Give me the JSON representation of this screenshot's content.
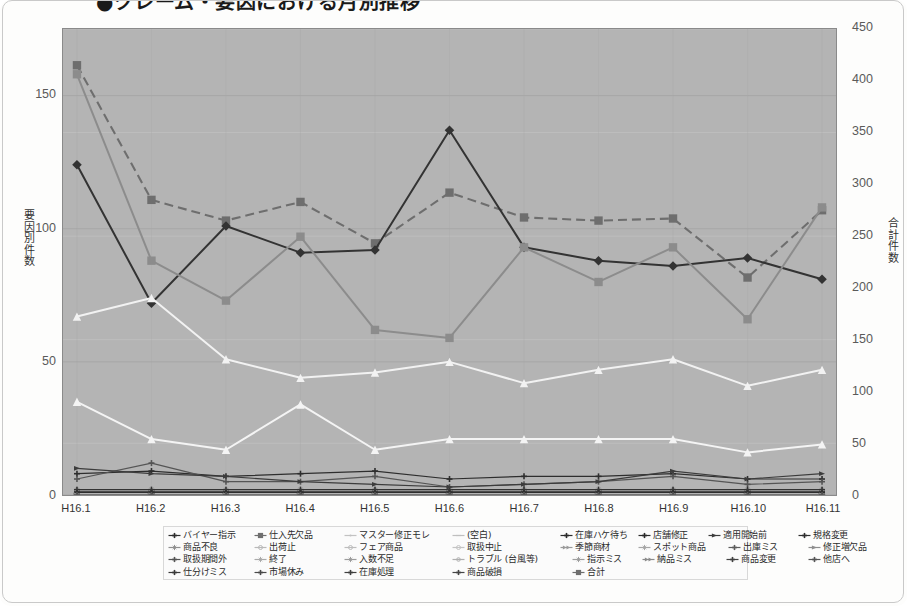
{
  "title": "●クレーム・要因における月別推移",
  "axes": {
    "y_left_title": "要因別件数",
    "y_right_title": "合計件数",
    "y_left_ticks": [
      0,
      50,
      100,
      150
    ],
    "y_right_ticks": [
      0,
      50,
      100,
      150,
      200,
      250,
      300,
      350,
      400,
      450
    ],
    "x_ticks": [
      "H16.1",
      "H16.2",
      "H16.3",
      "H16.4",
      "H16.5",
      "H16.6",
      "H16.7",
      "H16.8",
      "H16.9",
      "H16.10",
      "H16.11"
    ]
  },
  "chart_data": {
    "type": "line",
    "title": "●クレーム・要因における月別推移",
    "xlabel": "",
    "ylabel": "要因別件数",
    "ylabel_secondary": "合計件数",
    "grid": true,
    "legend_position": "bottom",
    "ylim": [
      0,
      175
    ],
    "ylim_secondary": [
      0,
      450
    ],
    "categories": [
      "H16.1",
      "H16.2",
      "H16.3",
      "H16.4",
      "H16.5",
      "H16.6",
      "H16.7",
      "H16.8",
      "H16.9",
      "H16.10",
      "H16.11"
    ],
    "series": [
      {
        "name": "バイヤー指示",
        "marker": "cross",
        "color": "#2e2e2e",
        "axis": "left",
        "values": [
          8,
          9,
          7,
          8,
          9,
          6,
          7,
          7,
          8,
          6,
          6
        ]
      },
      {
        "name": "商品不良",
        "marker": "star",
        "color": "#8f8f8f",
        "axis": "left",
        "values": [
          2,
          2,
          2,
          2,
          2,
          2,
          2,
          2,
          2,
          2,
          2
        ]
      },
      {
        "name": "取扱期間外",
        "marker": "cross",
        "color": "#555555",
        "axis": "left",
        "values": [
          6,
          12,
          5,
          5,
          7,
          3,
          4,
          5,
          7,
          4,
          5
        ]
      },
      {
        "name": "仕分けミス",
        "marker": "cross",
        "color": "#3a3a3a",
        "axis": "left",
        "values": [
          1,
          1,
          1,
          1,
          1,
          1,
          1,
          1,
          1,
          1,
          1
        ]
      },
      {
        "name": "仕入先欠品",
        "marker": "square",
        "color": "#8a8a8a",
        "axis": "left",
        "values": [
          1,
          1,
          1,
          1,
          1,
          1,
          1,
          1,
          1,
          1,
          1
        ]
      },
      {
        "name": "出荷止",
        "marker": "circle-open",
        "color": "#b9b9b9",
        "axis": "left",
        "values": [
          0,
          0,
          0,
          0,
          0,
          0,
          0,
          0,
          0,
          0,
          0
        ]
      },
      {
        "name": "終了",
        "marker": "star",
        "color": "#aaaaaa",
        "axis": "left",
        "values": [
          0,
          0,
          0,
          0,
          0,
          0,
          0,
          0,
          0,
          0,
          0
        ]
      },
      {
        "name": "市場休み",
        "marker": "cross",
        "color": "#4a4a4a",
        "axis": "left",
        "values": [
          1,
          1,
          1,
          1,
          1,
          1,
          1,
          1,
          1,
          1,
          1
        ]
      },
      {
        "name": "マスター修正モレ",
        "marker": "dot",
        "color": "#c0c0c0",
        "axis": "left",
        "values": [
          0,
          0,
          0,
          0,
          0,
          0,
          0,
          0,
          0,
          0,
          0
        ]
      },
      {
        "name": "フェア商品",
        "marker": "circle-open",
        "color": "#bdbdbd",
        "axis": "left",
        "values": [
          0,
          0,
          0,
          0,
          0,
          0,
          0,
          0,
          0,
          0,
          0
        ]
      },
      {
        "name": "入数不足",
        "marker": "star",
        "color": "#9c9c9c",
        "axis": "left",
        "values": [
          1,
          1,
          1,
          1,
          1,
          1,
          1,
          1,
          1,
          1,
          1
        ]
      },
      {
        "name": "在庫処理",
        "marker": "cross",
        "color": "#3f3f3f",
        "axis": "left",
        "values": [
          1,
          1,
          1,
          1,
          1,
          1,
          1,
          1,
          1,
          1,
          1
        ]
      },
      {
        "name": "(空白)",
        "marker": "dash",
        "color": "#c4c4c4",
        "axis": "left",
        "values": [
          0,
          0,
          0,
          0,
          0,
          0,
          0,
          0,
          0,
          0,
          0
        ]
      },
      {
        "name": "取扱中止",
        "marker": "circle-open",
        "color": "#c4c4c4",
        "axis": "left",
        "values": [
          0,
          0,
          0,
          0,
          0,
          0,
          0,
          0,
          0,
          0,
          0
        ]
      },
      {
        "name": "トラブル (台風等)",
        "marker": "circle-dot",
        "color": "#b0b0b0",
        "axis": "left",
        "values": [
          0,
          0,
          0,
          0,
          0,
          0,
          0,
          0,
          0,
          0,
          0
        ]
      },
      {
        "name": "商品破損",
        "marker": "cross",
        "color": "#454545",
        "axis": "left",
        "values": [
          1,
          1,
          1,
          1,
          1,
          1,
          1,
          1,
          1,
          1,
          1
        ]
      },
      {
        "name": "在庫ハケ待ち",
        "marker": "cross",
        "color": "#333333",
        "axis": "left",
        "values": [
          2,
          2,
          2,
          2,
          2,
          2,
          2,
          2,
          2,
          2,
          2
        ]
      },
      {
        "name": "季節商材",
        "marker": "double-arrow",
        "color": "#9a9a9a",
        "axis": "left",
        "values": [
          0,
          0,
          0,
          0,
          0,
          0,
          0,
          0,
          0,
          0,
          0
        ]
      },
      {
        "name": "指示ミス",
        "marker": "star",
        "color": "#9e9e9e",
        "axis": "left",
        "values": [
          1,
          1,
          1,
          1,
          1,
          1,
          1,
          1,
          1,
          1,
          1
        ]
      },
      {
        "name": "店舗修正",
        "marker": "cross",
        "color": "#2b2b2b",
        "axis": "left",
        "values": [
          1,
          1,
          1,
          1,
          1,
          1,
          1,
          1,
          1,
          1,
          1
        ]
      },
      {
        "name": "スポット商品",
        "marker": "star",
        "color": "#a6a6a6",
        "axis": "left",
        "values": [
          0,
          0,
          0,
          0,
          0,
          0,
          0,
          0,
          0,
          0,
          0
        ]
      },
      {
        "name": "納品ミス",
        "marker": "double-arrow",
        "color": "#8b8b8b",
        "axis": "left",
        "values": [
          0,
          0,
          0,
          0,
          0,
          0,
          0,
          0,
          0,
          0,
          0
        ]
      },
      {
        "name": "適用開始前",
        "marker": "arrow",
        "color": "#3c3c3c",
        "axis": "left",
        "values": [
          10,
          8,
          7,
          5,
          4,
          3,
          4,
          5,
          9,
          6,
          8
        ]
      },
      {
        "name": "出庫ミス",
        "marker": "cross",
        "color": "#5d5d5d",
        "axis": "left",
        "values": [
          1,
          1,
          1,
          1,
          1,
          1,
          1,
          1,
          1,
          1,
          1
        ]
      },
      {
        "name": "商品変更",
        "marker": "cross",
        "color": "#414141",
        "axis": "left",
        "values": [
          1,
          1,
          1,
          1,
          1,
          1,
          1,
          1,
          1,
          1,
          1
        ]
      },
      {
        "name": "規格変更",
        "marker": "cross",
        "color": "#2f2f2f",
        "axis": "left",
        "values": [
          1,
          1,
          1,
          1,
          1,
          1,
          1,
          1,
          1,
          1,
          1
        ]
      },
      {
        "name": "修正増欠品",
        "marker": "arrow",
        "color": "#8e8e8e",
        "axis": "left",
        "values": [
          0,
          0,
          0,
          0,
          0,
          0,
          0,
          0,
          0,
          0,
          0
        ]
      },
      {
        "name": "他店へ",
        "marker": "cross",
        "color": "#565656",
        "axis": "left",
        "values": [
          0,
          0,
          0,
          0,
          0,
          0,
          0,
          0,
          0,
          0,
          0
        ]
      },
      {
        "name": "合計",
        "marker": "square",
        "color": "#6e6e6e",
        "axis": "right",
        "values": [
          415,
          285,
          265,
          283,
          243,
          292,
          268,
          265,
          267,
          210,
          275
        ]
      }
    ],
    "highlight_series": [
      {
        "name": "系列A (濃灰・実線)",
        "marker": "diamond",
        "color": "#333333",
        "axis": "left",
        "values": [
          124,
          72,
          101,
          91,
          92,
          137,
          93,
          88,
          86,
          89,
          81
        ]
      },
      {
        "name": "系列B (中灰・実線)",
        "marker": "square",
        "color": "#8c8c8c",
        "axis": "left",
        "values": [
          158,
          88,
          73,
          97,
          62,
          59,
          93,
          80,
          93,
          66,
          108
        ]
      },
      {
        "name": "系列C (白・実線)",
        "marker": "triangle",
        "color": "#f2f2f2",
        "axis": "left",
        "values": [
          67,
          74,
          51,
          44,
          46,
          50,
          42,
          47,
          51,
          41,
          47
        ]
      },
      {
        "name": "系列D (白・下部)",
        "marker": "triangle",
        "color": "#f4f4f4",
        "axis": "left",
        "values": [
          35,
          21,
          17,
          34,
          17,
          21,
          21,
          21,
          21,
          16,
          19
        ]
      }
    ]
  },
  "legend": {
    "rows": [
      [
        {
          "label": "バイヤー指示",
          "marker": "cross",
          "color": "#2e2e2e"
        },
        {
          "label": "仕入先欠品",
          "marker": "square",
          "color": "#6f6f6f"
        },
        {
          "label": "マスター修正モレ",
          "marker": "dot",
          "color": "#c2c2c2"
        },
        {
          "label": "(空白)",
          "marker": "dash",
          "color": "#bfbfbf"
        },
        {
          "label": "在庫ハケ待ち",
          "marker": "cross",
          "color": "#2b2b2b"
        },
        {
          "label": "店舗修正",
          "marker": "cross",
          "color": "#2b2b2b"
        },
        {
          "label": "適用開始前",
          "marker": "arrow",
          "color": "#3c3c3c"
        },
        {
          "label": "規格変更",
          "marker": "cross",
          "color": "#2f2f2f"
        }
      ],
      [
        {
          "label": "商品不良",
          "marker": "star",
          "color": "#8f8f8f"
        },
        {
          "label": "出荷止",
          "marker": "circle-open",
          "color": "#b9b9b9"
        },
        {
          "label": "フェア商品",
          "marker": "circle-open",
          "color": "#bdbdbd"
        },
        {
          "label": "取扱中止",
          "marker": "circle-open",
          "color": "#c4c4c4"
        },
        {
          "label": "季節商材",
          "marker": "double-arrow",
          "color": "#9a9a9a"
        },
        {
          "label": "スポット商品",
          "marker": "star",
          "color": "#a6a6a6"
        },
        {
          "label": "出庫ミス",
          "marker": "cross",
          "color": "#5d5d5d"
        },
        {
          "label": "修正増欠品",
          "marker": "arrow",
          "color": "#8e8e8e"
        }
      ],
      [
        {
          "label": "取扱期間外",
          "marker": "cross",
          "color": "#555555"
        },
        {
          "label": "終了",
          "marker": "star",
          "color": "#aaaaaa"
        },
        {
          "label": "入数不足",
          "marker": "star",
          "color": "#9c9c9c"
        },
        {
          "label": "トラブル (台風等)",
          "marker": "circle-dot",
          "color": "#b0b0b0"
        },
        {
          "label": "指示ミス",
          "marker": "star",
          "color": "#9e9e9e"
        },
        {
          "label": "納品ミス",
          "marker": "double-arrow",
          "color": "#8b8b8b"
        },
        {
          "label": "商品変更",
          "marker": "cross",
          "color": "#414141"
        },
        {
          "label": "他店へ",
          "marker": "cross",
          "color": "#565656"
        }
      ],
      [
        {
          "label": "仕分けミス",
          "marker": "cross",
          "color": "#3a3a3a"
        },
        {
          "label": "市場休み",
          "marker": "cross",
          "color": "#4a4a4a"
        },
        {
          "label": "在庫処理",
          "marker": "cross",
          "color": "#3f3f3f"
        },
        {
          "label": "商品破損",
          "marker": "cross",
          "color": "#454545"
        },
        {
          "label": "合計",
          "marker": "square",
          "color": "#6e6e6e"
        }
      ]
    ],
    "row_offsets": [
      [
        0,
        86,
        176,
        284,
        392,
        470,
        540,
        630
      ],
      [
        0,
        86,
        176,
        284,
        392,
        470,
        560,
        640
      ],
      [
        0,
        86,
        176,
        284,
        404,
        474,
        558,
        640
      ],
      [
        0,
        86,
        176,
        284,
        404
      ]
    ]
  },
  "colors": {
    "plot_background": "#b4b4b4",
    "page_background": "#fdfdfc",
    "gridline": "#a0a0a0",
    "axis_text": "#5a5a5a"
  }
}
